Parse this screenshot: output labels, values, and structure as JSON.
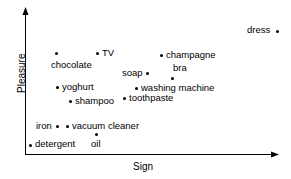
{
  "chart_data": {
    "type": "scatter",
    "title": "",
    "xlabel": "Sign",
    "ylabel": "Pleasure",
    "grid": false,
    "legend": null,
    "axis_style": "arrow-axes, no tick marks, no tick labels",
    "xlim": [
      0,
      100
    ],
    "ylim": [
      0,
      100
    ],
    "points": [
      {
        "label": "dress",
        "x": 99,
        "y": 86
      },
      {
        "label": "TV",
        "x": 28,
        "y": 70
      },
      {
        "label": "champagne",
        "x": 54,
        "y": 69
      },
      {
        "label": "chocolate",
        "x": 12,
        "y": 70
      },
      {
        "label": "soap",
        "x": 48,
        "y": 57
      },
      {
        "label": "bra",
        "x": 58,
        "y": 54
      },
      {
        "label": "yoghurt",
        "x": 13,
        "y": 47
      },
      {
        "label": "washing machine",
        "x": 44,
        "y": 46
      },
      {
        "label": "toothpaste",
        "x": 39,
        "y": 39
      },
      {
        "label": "shampoo",
        "x": 18,
        "y": 37
      },
      {
        "label": "iron",
        "x": 13,
        "y": 20
      },
      {
        "label": "vacuum cleaner",
        "x": 17,
        "y": 20
      },
      {
        "label": "oil",
        "x": 28,
        "y": 15
      },
      {
        "label": "detergent",
        "x": 2,
        "y": 7
      }
    ],
    "colors": {
      "marker": "#000000",
      "axis": "#000000",
      "text": "#000000",
      "background": "#ffffff"
    }
  },
  "points_px": [
    {
      "key": "dress",
      "dot": [
        277,
        31
      ],
      "label_left": 247,
      "label_top": 25,
      "label_align": "left"
    },
    {
      "key": "chocolate",
      "dot": [
        56,
        53
      ],
      "label_left": 51,
      "label_top": 60,
      "label_align": "left"
    },
    {
      "key": "TV",
      "dot": [
        97,
        53
      ],
      "label_left": 102,
      "label_top": 48,
      "label_align": "left"
    },
    {
      "key": "champagne",
      "dot": [
        161,
        55
      ],
      "label_left": 166,
      "label_top": 50,
      "label_align": "left"
    },
    {
      "key": "soap",
      "dot": [
        147,
        73
      ],
      "label_left": 122,
      "label_top": 68,
      "label_align": "left"
    },
    {
      "key": "bra",
      "dot": [
        172,
        78
      ],
      "label_left": 173,
      "label_top": 63,
      "label_align": "left"
    },
    {
      "key": "yoghurt",
      "dot": [
        57,
        87
      ],
      "label_left": 62,
      "label_top": 82,
      "label_align": "left"
    },
    {
      "key": "washing machine",
      "dot": [
        136,
        88
      ],
      "label_left": 141,
      "label_top": 83,
      "label_align": "left"
    },
    {
      "key": "toothpaste",
      "dot": [
        124,
        98
      ],
      "label_left": 129,
      "label_top": 93,
      "label_align": "left"
    },
    {
      "key": "shampoo",
      "dot": [
        70,
        101
      ],
      "label_left": 75,
      "label_top": 96,
      "label_align": "left"
    },
    {
      "key": "iron",
      "dot": [
        57,
        126
      ],
      "label_left": 36,
      "label_top": 121,
      "label_align": "left"
    },
    {
      "key": "vacuum cleaner",
      "dot": [
        67,
        126
      ],
      "label_left": 72,
      "label_top": 121,
      "label_align": "left"
    },
    {
      "key": "oil",
      "dot": [
        96,
        134
      ],
      "label_left": 91,
      "label_top": 139,
      "label_align": "left"
    },
    {
      "key": "detergent",
      "dot": [
        30,
        145
      ],
      "label_left": 35,
      "label_top": 139,
      "label_align": "left"
    }
  ],
  "axes": {
    "x_title": "Sign",
    "y_title": "Pleasure"
  }
}
